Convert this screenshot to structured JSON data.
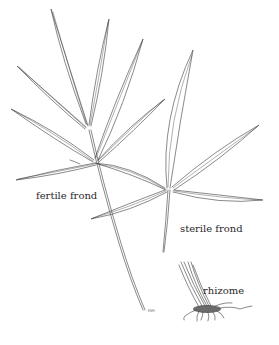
{
  "figure": {
    "labels": {
      "fertile": "fertile frond",
      "sterile": "sterile frond",
      "rhizome": "rhizome"
    },
    "signature": "EMH",
    "colors": {
      "line": "#3a3a3a",
      "background": "#ffffff",
      "text": "#2a2a2a"
    }
  }
}
